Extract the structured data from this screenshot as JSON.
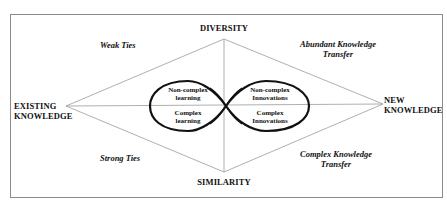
{
  "diagram": {
    "axes": {
      "top": "DIVERSITY",
      "bottom": "SIMILARITY",
      "left_line1": "EXISTING",
      "left_line2": "KNOWLEDGE",
      "right_line1": "NEW",
      "right_line2": "KNOWLEDGE"
    },
    "quadrants": {
      "top_left": "Weak Ties",
      "top_right_line1": "Abundant Knowledge",
      "top_right_line2": "Transfer",
      "bottom_left": "Strong Ties",
      "bottom_right_line1": "Complex Knowledge",
      "bottom_right_line2": "Transfer"
    },
    "left_loop": {
      "upper_line1": "Non-complex",
      "upper_line2": "learning",
      "lower_line1": "Complex",
      "lower_line2": "learning"
    },
    "right_loop": {
      "upper_line1": "Non-complex",
      "upper_line2": "Innovations",
      "lower_line1": "Complex",
      "lower_line2": "Innovations"
    },
    "colors": {
      "frame": "#8a8a8a",
      "lines": "#9a9a9a",
      "loops": "#111111",
      "text": "#111111"
    }
  }
}
